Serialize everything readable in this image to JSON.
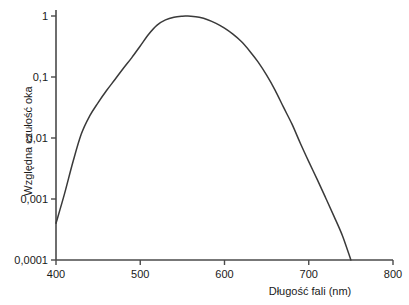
{
  "chart_data": {
    "type": "line",
    "title": "",
    "subtitle": "",
    "xlabel": "Długość fali (nm)",
    "ylabel": "Względna czułość oka",
    "xlim": [
      400,
      800
    ],
    "ylim": [
      0.0001,
      1
    ],
    "yscale": "log",
    "xscale": "linear",
    "grid": false,
    "legend": false,
    "legend_position": "none",
    "line_color": "#3a3a3a",
    "axis_color": "#4a4a4a",
    "background_color": "#ffffff",
    "xticks": [
      400,
      500,
      600,
      700,
      800
    ],
    "xtick_labels": [
      "400",
      "500",
      "600",
      "700",
      "800"
    ],
    "yticks": [
      1,
      0.1,
      0.01,
      0.001,
      0.0001
    ],
    "ytick_labels": [
      "1",
      "0,1",
      "0,01",
      "0,001",
      "0,0001"
    ],
    "series": [
      {
        "name": "Względna czułość oka",
        "x": [
          400,
          410,
          420,
          430,
          440,
          450,
          460,
          470,
          480,
          490,
          500,
          510,
          520,
          530,
          540,
          550,
          555,
          560,
          570,
          580,
          590,
          600,
          610,
          620,
          630,
          640,
          650,
          660,
          670,
          680,
          690,
          700,
          710,
          720,
          730,
          740,
          750
        ],
        "y": [
          0.0004,
          0.0012,
          0.004,
          0.0116,
          0.023,
          0.038,
          0.06,
          0.091,
          0.139,
          0.208,
          0.323,
          0.503,
          0.71,
          0.862,
          0.954,
          0.995,
          1.0,
          0.995,
          0.952,
          0.87,
          0.757,
          0.631,
          0.503,
          0.381,
          0.265,
          0.175,
          0.107,
          0.061,
          0.032,
          0.017,
          0.0082,
          0.0041,
          0.0021,
          0.00105,
          0.00052,
          0.00025,
          0.0001
        ]
      }
    ]
  },
  "axes": {
    "y_title": "Względna czułość oka",
    "x_title": "Długość fali (nm)"
  }
}
